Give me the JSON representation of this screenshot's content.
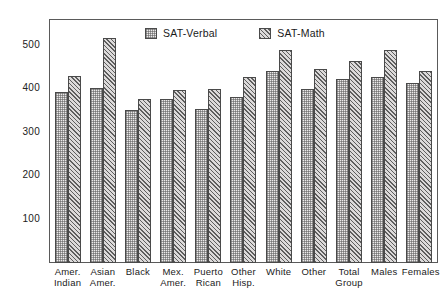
{
  "chart_data": {
    "type": "bar",
    "title": "",
    "xlabel": "",
    "ylabel": "SAT Mean Score",
    "ylim": [
      0,
      560
    ],
    "yticks": [
      100,
      200,
      300,
      400,
      500
    ],
    "grid": false,
    "legend_position": "top-center",
    "categories": [
      "Amer. Indian",
      "Asian Amer.",
      "Black",
      "Mex. Amer.",
      "Puerto Rican",
      "Other Hisp.",
      "White",
      "Other",
      "Total Group",
      "Males",
      "Females"
    ],
    "category_lines": [
      [
        "Amer.",
        "Indian"
      ],
      [
        "Asian",
        "Amer."
      ],
      [
        "Black",
        ""
      ],
      [
        "Mex.",
        "Amer."
      ],
      [
        "Puerto",
        "Rican"
      ],
      [
        "Other",
        "Hisp."
      ],
      [
        "White",
        ""
      ],
      [
        "Other",
        ""
      ],
      [
        "Total",
        "Group"
      ],
      [
        "Males",
        ""
      ],
      [
        "Females",
        ""
      ]
    ],
    "series": [
      {
        "name": "SAT-Verbal",
        "fill": "stipple",
        "color": "#eceaea",
        "values": [
          393,
          404,
          352,
          378,
          355,
          383,
          443,
          401,
          424,
          428,
          414
        ]
      },
      {
        "name": "SAT-Math",
        "fill": "diagonal-hatch",
        "color": "#dcdada",
        "values": [
          432,
          518,
          377,
          398,
          401,
          428,
          490,
          447,
          466,
          491,
          443
        ]
      }
    ]
  },
  "axis": {
    "y_title": "SAT Mean Score",
    "y_tick_labels": [
      "500",
      "400",
      "300",
      "200",
      "100"
    ],
    "y_tick_values": [
      500,
      400,
      300,
      200,
      100
    ]
  },
  "legend": {
    "items": [
      {
        "label": "SAT-Verbal",
        "swatch": "stipple-swatch"
      },
      {
        "label": "SAT-Math",
        "swatch": "hatch-swatch"
      }
    ]
  },
  "footer": {
    "note": ""
  },
  "colors": {
    "frame": "#5a5a5a",
    "bar_outline": "#4a4a4a",
    "verbal_fill": "#eceaea",
    "math_fill": "#dcdada",
    "text": "#1a1a1a",
    "background": "#ffffff"
  }
}
